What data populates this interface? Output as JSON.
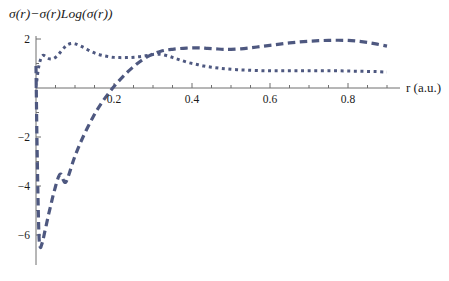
{
  "chart_data": {
    "type": "line",
    "title": "σ(r)−σ(r)Log(σ(r))",
    "xlabel": "r (a.u.)",
    "ylabel": "",
    "xlim": [
      0.0,
      0.93
    ],
    "ylim": [
      -6.9,
      2.4
    ],
    "xticks": [
      0.2,
      0.4,
      0.6,
      0.8
    ],
    "xtick_labels": [
      "0.2",
      "0.4",
      "0.6",
      "0.8"
    ],
    "xminor_ticks": [
      0.05,
      0.1,
      0.15,
      0.25,
      0.3,
      0.35,
      0.45,
      0.5,
      0.55,
      0.65,
      0.7,
      0.75,
      0.85,
      0.9
    ],
    "yticks": [
      2,
      -2,
      -4,
      -6
    ],
    "ytick_labels": [
      "2",
      "-2",
      "-4",
      "-6"
    ],
    "yminor_ticks": [
      1,
      -1,
      -3,
      -5
    ],
    "grid": false,
    "legend": "none",
    "axis_origin": {
      "x": 0.0,
      "y": 0.0
    },
    "line_color": "#4e5880",
    "series": [
      {
        "name": "dotted-curve",
        "style": "dotted",
        "dash_pattern": "3,3.6",
        "line_width": 3.0,
        "x": [
          0.0,
          0.004,
          0.008,
          0.013,
          0.018,
          0.024,
          0.03,
          0.038,
          0.046,
          0.055,
          0.063,
          0.072,
          0.08,
          0.09,
          0.1,
          0.112,
          0.125,
          0.14,
          0.155,
          0.17,
          0.185,
          0.2,
          0.215,
          0.23,
          0.245,
          0.26,
          0.275,
          0.29,
          0.3,
          0.312,
          0.325,
          0.34,
          0.355,
          0.37,
          0.39,
          0.41,
          0.43,
          0.45,
          0.47,
          0.49,
          0.515,
          0.54,
          0.57,
          0.6,
          0.63,
          0.66,
          0.69,
          0.72,
          0.75,
          0.78,
          0.81,
          0.84,
          0.87,
          0.9
        ],
        "y": [
          0.0,
          0.55,
          0.95,
          1.22,
          1.33,
          1.3,
          1.22,
          1.18,
          1.21,
          1.32,
          1.47,
          1.64,
          1.76,
          1.82,
          1.8,
          1.73,
          1.63,
          1.5,
          1.4,
          1.33,
          1.28,
          1.25,
          1.24,
          1.24,
          1.25,
          1.27,
          1.3,
          1.34,
          1.37,
          1.38,
          1.36,
          1.3,
          1.22,
          1.14,
          1.04,
          0.97,
          0.9,
          0.85,
          0.81,
          0.78,
          0.75,
          0.73,
          0.71,
          0.7,
          0.7,
          0.7,
          0.7,
          0.7,
          0.7,
          0.7,
          0.69,
          0.68,
          0.67,
          0.65
        ]
      },
      {
        "name": "dashed-curve",
        "style": "dashed",
        "dash_pattern": "7.5,4.5",
        "line_width": 3.2,
        "x": [
          0.0,
          0.002,
          0.004,
          0.006,
          0.008,
          0.011,
          0.014,
          0.018,
          0.022,
          0.027,
          0.032,
          0.038,
          0.044,
          0.05,
          0.054,
          0.058,
          0.062,
          0.066,
          0.07,
          0.076,
          0.084,
          0.092,
          0.1,
          0.11,
          0.12,
          0.132,
          0.145,
          0.158,
          0.172,
          0.186,
          0.2,
          0.215,
          0.23,
          0.245,
          0.26,
          0.275,
          0.29,
          0.305,
          0.32,
          0.335,
          0.35,
          0.368,
          0.386,
          0.404,
          0.422,
          0.44,
          0.46,
          0.48,
          0.5,
          0.525,
          0.55,
          0.575,
          0.6,
          0.625,
          0.65,
          0.675,
          0.7,
          0.725,
          0.75,
          0.775,
          0.8,
          0.825,
          0.85,
          0.875,
          0.9
        ],
        "y": [
          0.9,
          -1.6,
          -3.5,
          -5.1,
          -6.15,
          -6.5,
          -6.42,
          -6.2,
          -5.9,
          -5.55,
          -5.18,
          -4.78,
          -4.38,
          -4.02,
          -3.8,
          -3.62,
          -3.52,
          -3.55,
          -3.75,
          -3.85,
          -3.55,
          -3.15,
          -2.78,
          -2.38,
          -2.02,
          -1.62,
          -1.22,
          -0.86,
          -0.52,
          -0.22,
          0.06,
          0.33,
          0.58,
          0.8,
          1.0,
          1.17,
          1.31,
          1.42,
          1.5,
          1.55,
          1.58,
          1.61,
          1.63,
          1.64,
          1.64,
          1.62,
          1.6,
          1.58,
          1.58,
          1.6,
          1.64,
          1.69,
          1.74,
          1.79,
          1.84,
          1.88,
          1.91,
          1.93,
          1.945,
          1.95,
          1.94,
          1.91,
          1.86,
          1.79,
          1.71
        ]
      }
    ]
  },
  "axes_geometry": {
    "x_pixel_at_zero": 36,
    "y_pixel_at_zero": 88,
    "x_pixels_per_unit": 390,
    "y_pixels_per_unit": 24.5,
    "x_axis_start_px": 36,
    "x_axis_end_px": 400,
    "y_axis_top_px": 36,
    "y_axis_bottom_px": 265
  }
}
